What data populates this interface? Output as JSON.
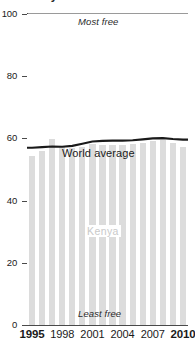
{
  "chart_data": {
    "type": "bar",
    "title": "Kenya",
    "subtitle": "",
    "xlabel": "",
    "ylabel": "",
    "ylim": [
      0,
      100
    ],
    "xlim": [
      1995,
      2010
    ],
    "grid": false,
    "legend_position": "inline-annotation",
    "categories": [
      1995,
      1996,
      1997,
      1998,
      1999,
      2000,
      2001,
      2002,
      2003,
      2004,
      2005,
      2006,
      2007,
      2008,
      2009,
      2010
    ],
    "series": [
      {
        "name": "Kenya",
        "type": "bar",
        "color": "#dcdcdc",
        "values": [
          54.4,
          56.0,
          59.8,
          57.6,
          57.0,
          57.2,
          58.2,
          57.9,
          58.0,
          57.8,
          58.3,
          58.4,
          59.3,
          59.6,
          58.6,
          57.4
        ]
      },
      {
        "name": "World average",
        "type": "line",
        "color": "#1a1a1a",
        "values": [
          57.0,
          57.2,
          57.4,
          57.3,
          57.6,
          58.3,
          59.0,
          59.2,
          59.3,
          59.3,
          59.4,
          59.7,
          60.0,
          60.1,
          59.8,
          59.6
        ]
      }
    ],
    "y_ticks": [
      0,
      20,
      40,
      60,
      80,
      100
    ],
    "y_tick_labels": [
      "0",
      "20",
      "40",
      "60",
      "80",
      "100"
    ],
    "x_ticks": [
      1995,
      1998,
      2001,
      2004,
      2007,
      2010
    ],
    "x_tick_labels": [
      "1995",
      "1998",
      "2001",
      "2004",
      "2007",
      "2010"
    ],
    "x_tick_bold": [
      true,
      false,
      false,
      false,
      false,
      true
    ],
    "annotations": [
      {
        "name": "most-free",
        "text": "Most free"
      },
      {
        "name": "least-free",
        "text": "Least free"
      },
      {
        "name": "world-average",
        "text": "World average"
      },
      {
        "name": "kenya",
        "text": "Kenya"
      }
    ]
  },
  "labels": {
    "most_free": "Most free",
    "least_free": "Least free",
    "world_average": "World average",
    "kenya": "Kenya"
  },
  "colors": {
    "bar": "#dcdcdc",
    "line": "#1a1a1a",
    "axis": "#4a4a4a",
    "frame": "#9a9a9a",
    "kenya_label": "#c9c9c9",
    "background": "#ffffff"
  }
}
